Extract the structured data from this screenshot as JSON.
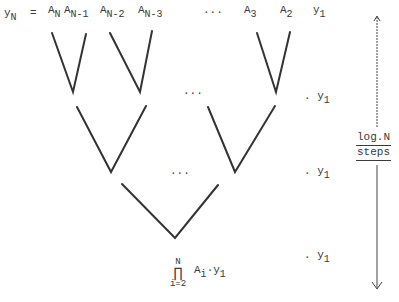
{
  "top_row": {
    "lhs": "y",
    "lhs_sub": "N",
    "equals": "=",
    "terms": [
      {
        "base": "A",
        "sub": "N"
      },
      {
        "base": "A",
        "sub": "N-1"
      },
      {
        "base": "A",
        "sub": "N-2"
      },
      {
        "base": "A",
        "sub": "N-3"
      },
      {
        "ellipsis": "..."
      },
      {
        "base": "A",
        "sub": "3"
      },
      {
        "base": "A",
        "sub": "2"
      },
      {
        "base": "y",
        "sub": "1"
      }
    ]
  },
  "levels": [
    {
      "label": ". y",
      "sub": "1",
      "ellipsis": "..."
    },
    {
      "label": ". y",
      "sub": "1",
      "ellipsis": "..."
    },
    {
      "label": ". y",
      "sub": "1"
    }
  ],
  "result": {
    "product_upper": "N",
    "product_symbol": "∏",
    "product_lower": "i=2",
    "term": "A",
    "term_sub": "i",
    "dot": "·",
    "y": "y",
    "y_sub": "1"
  },
  "side_label": {
    "line1": "log.N",
    "line2": "steps"
  },
  "colors": {
    "ink": "#3a3a3a",
    "background": "#ffffff"
  }
}
